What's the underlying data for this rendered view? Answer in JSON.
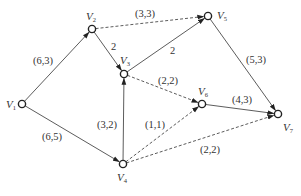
{
  "diagram": {
    "type": "directed-network-flow-graph",
    "nodes": [
      {
        "id": "V1",
        "label": "V",
        "sub": "1",
        "x": 22,
        "y": 104,
        "lx": 6,
        "ly": 108
      },
      {
        "id": "V2",
        "label": "V",
        "sub": "2",
        "x": 92,
        "y": 29,
        "lx": 86,
        "ly": 20
      },
      {
        "id": "V3",
        "label": "V",
        "sub": "3",
        "x": 124,
        "y": 74,
        "lx": 120,
        "ly": 64
      },
      {
        "id": "V4",
        "label": "V",
        "sub": "4",
        "x": 123,
        "y": 164,
        "lx": 117,
        "ly": 181
      },
      {
        "id": "V5",
        "label": "V",
        "sub": "5",
        "x": 208,
        "y": 16,
        "lx": 217,
        "ly": 19
      },
      {
        "id": "V6",
        "label": "V",
        "sub": "6",
        "x": 202,
        "y": 104,
        "lx": 198,
        "ly": 95
      },
      {
        "id": "V7",
        "label": "V",
        "sub": "7",
        "x": 278,
        "y": 114,
        "lx": 283,
        "ly": 131
      }
    ],
    "edges": [
      {
        "from": "V1",
        "to": "V2",
        "style": "solid",
        "label": "(6,3)",
        "lx": 33,
        "ly": 64
      },
      {
        "from": "V1",
        "to": "V4",
        "style": "solid",
        "label": "(6,5)",
        "lx": 42,
        "ly": 140
      },
      {
        "from": "V2",
        "to": "V3",
        "style": "solid",
        "label": "2",
        "lx": 111,
        "ly": 50
      },
      {
        "from": "V2",
        "to": "V5",
        "style": "dashed",
        "label": "(3,3)",
        "lx": 135,
        "ly": 17
      },
      {
        "from": "V3",
        "to": "V5",
        "style": "solid",
        "label": "2",
        "lx": 170,
        "ly": 54
      },
      {
        "from": "V3",
        "to": "V6",
        "style": "dashed",
        "label": "(2,2)",
        "lx": 158,
        "ly": 84
      },
      {
        "from": "V4",
        "to": "V3",
        "style": "solid",
        "label": "(3,2)",
        "lx": 97,
        "ly": 128
      },
      {
        "from": "V4",
        "to": "V6",
        "style": "dashed",
        "label": "(1,1)",
        "lx": 145,
        "ly": 128
      },
      {
        "from": "V4",
        "to": "V7",
        "style": "dashed",
        "label": "(2,2)",
        "lx": 200,
        "ly": 153
      },
      {
        "from": "V5",
        "to": "V7",
        "style": "solid",
        "label": "(5,3)",
        "lx": 246,
        "ly": 63
      },
      {
        "from": "V6",
        "to": "V7",
        "style": "solid",
        "label": "(4,3)",
        "lx": 232,
        "ly": 103
      }
    ]
  },
  "colors": {
    "edge": "#4a4a4a",
    "node_stroke": "#222222",
    "text": "#333333",
    "background": "#ffffff"
  }
}
